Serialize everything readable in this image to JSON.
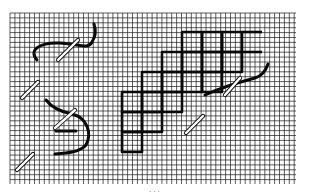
{
  "diagram": {
    "type": "needlework stitch diagram",
    "background": "#ffffff",
    "grid": {
      "x": 10,
      "y": 13,
      "width": 286,
      "height": 171,
      "cell": 4.9,
      "color": "#1a1a1a"
    },
    "thread_color": "#0a0a0a",
    "needle_color": "#ffffff",
    "stitch_block": {
      "cell": 20,
      "rows": [
        {
          "y": 32,
          "x_start": 182,
          "count": 3,
          "tail_to": 262
        },
        {
          "y": 52,
          "x_start": 162,
          "count": 4,
          "tail_to": 262
        },
        {
          "y": 72,
          "x_start": 142,
          "count": 4
        },
        {
          "y": 92,
          "x_start": 122,
          "count": 3
        },
        {
          "y": 112,
          "x_start": 122,
          "count": 2
        },
        {
          "y": 132,
          "x_start": 122,
          "count": 1
        }
      ]
    },
    "needles": [
      {
        "label": "needle-top-left",
        "x1": 58,
        "y1": 60,
        "x2": 78,
        "y2": 40
      },
      {
        "label": "needle-left-upper",
        "x1": 22,
        "y1": 98,
        "x2": 38,
        "y2": 82
      },
      {
        "label": "needle-left-middle",
        "x1": 55,
        "y1": 128,
        "x2": 75,
        "y2": 110
      },
      {
        "label": "needle-left-lower",
        "x1": 17,
        "y1": 170,
        "x2": 33,
        "y2": 154
      },
      {
        "label": "needle-block-right",
        "x1": 225,
        "y1": 95,
        "x2": 240,
        "y2": 78
      },
      {
        "label": "needle-block-lower",
        "x1": 186,
        "y1": 133,
        "x2": 203,
        "y2": 116
      }
    ],
    "threads": [
      {
        "label": "thread-top-left",
        "d": "M37 60 C28 50 40 42 60 43 C80 44 88 50 92 42 C96 36 96 30 94 24"
      },
      {
        "label": "thread-left-middle",
        "d": "M46 100 C52 108 62 112 72 114 C88 118 92 134 86 145 C80 152 68 153 55 154"
      },
      {
        "label": "thread-left-stub",
        "d": "M56 131 L76 131"
      },
      {
        "label": "thread-block-tail",
        "d": "M205 95 C220 88 240 82 255 78 C262 76 266 70 268 64"
      }
    ],
    "caption": "· · ·"
  }
}
